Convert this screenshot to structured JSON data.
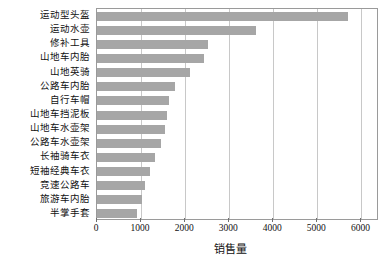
{
  "chart_data": {
    "type": "bar",
    "orientation": "horizontal",
    "title": "",
    "xlabel": "销售量",
    "ylabel": "",
    "xlim": [
      0,
      6400
    ],
    "ylim": [
      0,
      15
    ],
    "grid": "vertical",
    "legend": "none",
    "bar_color": "#a6a6a6",
    "xticks": [
      0,
      1000,
      2000,
      3000,
      4000,
      5000,
      6000
    ],
    "xtick_labels": [
      "0",
      "1000",
      "2000",
      "3000",
      "4000",
      "5000",
      "6000"
    ],
    "categories": [
      "运动型头盔",
      "运动水壶",
      "修补工具",
      "山地车内胎",
      "山地英骑",
      "公路车内胎",
      "自行车帽",
      "山地车挡泥板",
      "山地车水壶架",
      "公路车水壶架",
      "长袖骑车衣",
      "短袖经典车衣",
      "竞速公路车",
      "旅游车内胎",
      "半掌手套"
    ],
    "values": [
      5700,
      3600,
      2530,
      2420,
      2100,
      1760,
      1630,
      1590,
      1550,
      1460,
      1310,
      1200,
      1090,
      1010,
      900
    ]
  }
}
